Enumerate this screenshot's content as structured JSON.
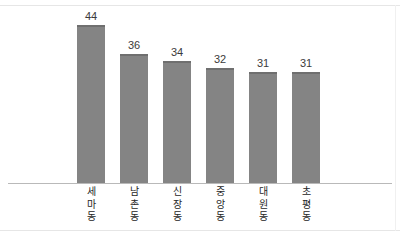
{
  "chart_data": {
    "type": "bar",
    "title": "",
    "subtitle": "",
    "xlabel": "",
    "ylabel": "",
    "categories": [
      "세마동",
      "남촌동",
      "신장동",
      "중앙동",
      "대원동",
      "초평동"
    ],
    "values": [
      44,
      36,
      34,
      32,
      31,
      31
    ],
    "value_labels": [
      "44",
      "36",
      "34",
      "32",
      "31",
      "31"
    ],
    "series": [
      {
        "name": "",
        "values": [
          44,
          36,
          34,
          32,
          31,
          31
        ]
      }
    ],
    "ylim": [
      0,
      51
    ],
    "grid": false,
    "legend": false,
    "legend_position": "none",
    "axis_visible": {
      "x": true,
      "y": false
    },
    "colors": {
      "bar_fill": "#848484",
      "bar_top_edge": "#6f6f6f",
      "axis_line": "#b9b9b9",
      "frame_line": "#e6e6e6",
      "value_text": "#3b3b3b",
      "tick_text": "#262626",
      "background": "#ffffff"
    },
    "bars": [
      {
        "category": "세마동",
        "value": 44,
        "label": "44",
        "chars": [
          "세",
          "마",
          "동"
        ]
      },
      {
        "category": "남촌동",
        "value": 36,
        "label": "36",
        "chars": [
          "남",
          "촌",
          "동"
        ]
      },
      {
        "category": "신장동",
        "value": 34,
        "label": "34",
        "chars": [
          "신",
          "장",
          "동"
        ]
      },
      {
        "category": "중앙동",
        "value": 32,
        "label": "32",
        "chars": [
          "중",
          "앙",
          "동"
        ]
      },
      {
        "category": "대원동",
        "value": 31,
        "label": "31",
        "chars": [
          "대",
          "원",
          "동"
        ]
      },
      {
        "category": "초평동",
        "value": 31,
        "label": "31",
        "chars": [
          "초",
          "평",
          "동"
        ]
      }
    ]
  }
}
